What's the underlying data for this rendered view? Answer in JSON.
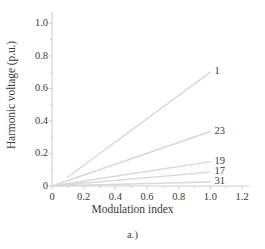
{
  "chart_data": {
    "type": "line",
    "title": "",
    "caption": "a.)",
    "xlabel": "Modulation index",
    "ylabel": "Harmonic voltage (p.u.)",
    "xlim": [
      0,
      1.25
    ],
    "ylim": [
      0,
      1.07
    ],
    "xticks": [
      0,
      0.2,
      0.4,
      0.6,
      0.8,
      1.0,
      1.2
    ],
    "xticklabels": [
      "0",
      "0.2",
      "0.4",
      "0.6",
      "0.8",
      "1.0",
      "1.2"
    ],
    "yticks": [
      0,
      0.2,
      0.4,
      0.6,
      0.8,
      1.0
    ],
    "yticklabels": [
      "0",
      "0.2",
      "0.4",
      "0.6",
      "0.8",
      "1.0"
    ],
    "grid": false,
    "legend_position": "inline-right-end-of-line",
    "line_color": "#d8d8d8",
    "axis_color": "#cfcfcf",
    "series": [
      {
        "name": "1",
        "label": "1",
        "x": [
          0.1,
          1.0
        ],
        "y": [
          0.055,
          0.7
        ]
      },
      {
        "name": "23",
        "label": "23",
        "x": [
          0.0,
          1.0
        ],
        "y": [
          0.0,
          0.335
        ]
      },
      {
        "name": "19",
        "label": "19",
        "x": [
          0.0,
          1.0
        ],
        "y": [
          0.0,
          0.15
        ]
      },
      {
        "name": "17",
        "label": "17",
        "x": [
          0.0,
          1.0
        ],
        "y": [
          0.0,
          0.085
        ]
      },
      {
        "name": "31",
        "label": "31",
        "x": [
          0.0,
          1.0
        ],
        "y": [
          0.0,
          0.025
        ]
      }
    ]
  }
}
